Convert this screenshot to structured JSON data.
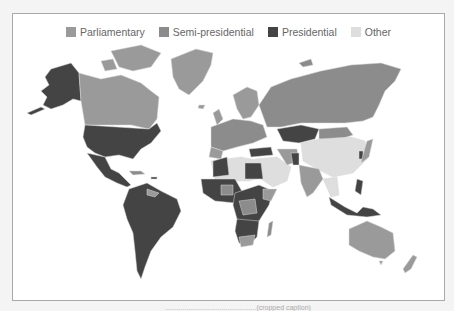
{
  "legend": {
    "items": [
      {
        "label": "Parliamentary",
        "color": "#9a9a9a"
      },
      {
        "label": "Semi-presidential",
        "color": "#8c8c8c"
      },
      {
        "label": "Presidential",
        "color": "#444444"
      },
      {
        "label": "Other",
        "color": "#dedede"
      }
    ]
  },
  "map": {
    "title": "World map of systems of government",
    "colors": {
      "parliamentary": "#9a9a9a",
      "semi_presidential": "#8c8c8c",
      "presidential": "#444444",
      "other": "#dedede",
      "ocean": "#ffffff",
      "border": "#d0d0d0"
    }
  },
  "caption": {
    "text": "...............................................(cropped caption)"
  }
}
